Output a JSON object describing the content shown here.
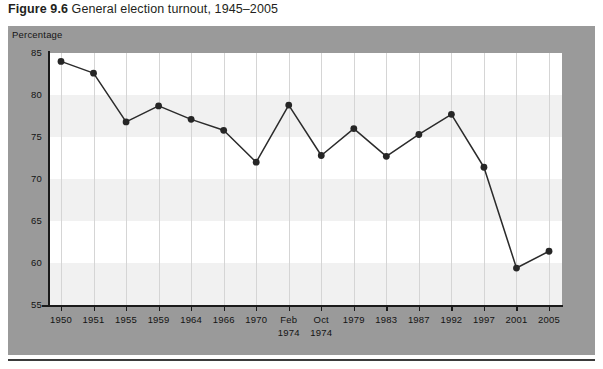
{
  "title": {
    "number": "Figure 9.6",
    "text": " General election turnout, 1945–2005",
    "full": "Figure 9.6 General election turnout, 1945–2005"
  },
  "axis_caption": "Percentage",
  "colors": {
    "panel_background": "#9d9d9d",
    "plot_background": "#ffffff",
    "band": "#f1f1f1",
    "gridline": "#d5d5d5",
    "axis": "#1a1a1a",
    "series_line": "#2b2b2b",
    "marker": "#262626",
    "title_text": "#231f20"
  },
  "chart_data": {
    "type": "line",
    "title": "Figure 9.6 General election turnout, 1945–2005",
    "xlabel": "",
    "ylabel": "Percentage",
    "ylim": [
      55,
      85
    ],
    "yticks": [
      55,
      60,
      65,
      70,
      75,
      80,
      85
    ],
    "grid": "vertical",
    "legend": "none",
    "categories": [
      "1950",
      "1951",
      "1955",
      "1959",
      "1964",
      "1966",
      "1970",
      "Feb 1974",
      "Oct 1974",
      "1979",
      "1983",
      "1987",
      "1992",
      "1997",
      "2001",
      "2005"
    ],
    "tick_labels": [
      {
        "line1": "1950",
        "line2": ""
      },
      {
        "line1": "1951",
        "line2": ""
      },
      {
        "line1": "1955",
        "line2": ""
      },
      {
        "line1": "1959",
        "line2": ""
      },
      {
        "line1": "1964",
        "line2": ""
      },
      {
        "line1": "1966",
        "line2": ""
      },
      {
        "line1": "1970",
        "line2": ""
      },
      {
        "line1": "Feb",
        "line2": "1974"
      },
      {
        "line1": "Oct",
        "line2": "1974"
      },
      {
        "line1": "1979",
        "line2": ""
      },
      {
        "line1": "1983",
        "line2": ""
      },
      {
        "line1": "1987",
        "line2": ""
      },
      {
        "line1": "1992",
        "line2": ""
      },
      {
        "line1": "1997",
        "line2": ""
      },
      {
        "line1": "2001",
        "line2": ""
      },
      {
        "line1": "2005",
        "line2": ""
      }
    ],
    "values": [
      84.0,
      82.6,
      76.8,
      78.7,
      77.1,
      75.8,
      72.0,
      78.8,
      72.8,
      76.0,
      72.7,
      75.3,
      77.7,
      71.4,
      59.4,
      61.4
    ]
  }
}
